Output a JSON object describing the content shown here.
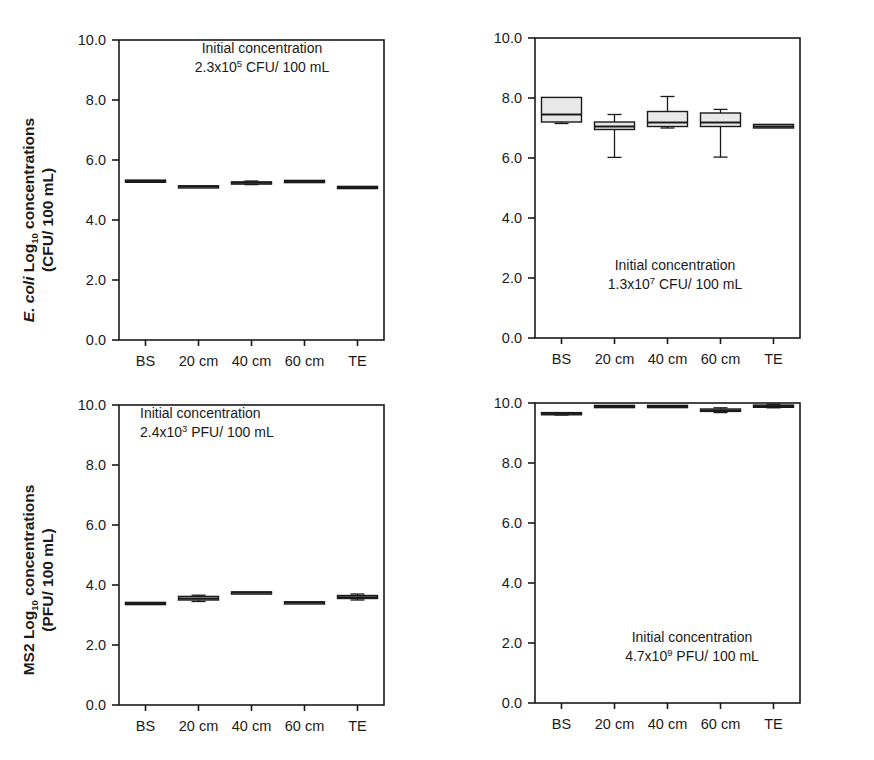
{
  "figure": {
    "background": "#ffffff",
    "line_color": "#1a1a1a",
    "box_fill": "#e8e8e8"
  },
  "axis_titles": {
    "ecoli_line1_italic": "E. coli",
    "ecoli_line1_rest": " Log",
    "ecoli_line1_sub": "10",
    "ecoli_line1_tail": " concentrations",
    "ecoli_line2": "(CFU/ 100 mL)",
    "ms2_line1_main": "MS2 Log",
    "ms2_line1_sub": "10",
    "ms2_line1_tail": " concentrations",
    "ms2_line2": "(PFU/ 100 mL)"
  },
  "axis": {
    "y_ticks": [
      "10.0",
      "8.0",
      "6.0",
      "4.0",
      "2.0",
      "0.0"
    ],
    "y_values": [
      10.0,
      8.0,
      6.0,
      4.0,
      2.0,
      0.0
    ],
    "y_min": 0.0,
    "y_max": 10.0,
    "categories": [
      "BS",
      "20 cm",
      "40 cm",
      "60 cm",
      "TE"
    ]
  },
  "annotations": {
    "line1": "Initial concentration",
    "panel_a": {
      "mantissa": "2.3x10",
      "exponent": "5",
      "units": " CFU/ 100 mL"
    },
    "panel_b": {
      "mantissa": "1.3x10",
      "exponent": "7",
      "units": " CFU/ 100 mL"
    },
    "panel_c": {
      "mantissa": "2.4x10",
      "exponent": "3",
      "units": " PFU/ 100 mL"
    },
    "panel_d": {
      "mantissa": "4.7x10",
      "exponent": "9",
      "units": " PFU/ 100 mL"
    }
  },
  "chart_data": [
    {
      "id": "panel_a",
      "type": "box",
      "title": "",
      "position": "top-left",
      "xlabel": "",
      "ylabel": "E. coli Log10 concentrations (CFU/ 100 mL)",
      "ylim": [
        0.0,
        10.0
      ],
      "yticks": [
        0.0,
        2.0,
        4.0,
        6.0,
        8.0,
        10.0
      ],
      "grid": false,
      "legend": "none",
      "annotation": "Initial concentration 2.3x10^5 CFU/ 100 mL",
      "categories": [
        "BS",
        "20 cm",
        "40 cm",
        "60 cm",
        "TE"
      ],
      "boxes": [
        {
          "category": "BS",
          "whisker_low": 5.25,
          "q1": 5.27,
          "median": 5.3,
          "q3": 5.33,
          "whisker_high": 5.35
        },
        {
          "category": "20 cm",
          "whisker_low": 5.08,
          "q1": 5.1,
          "median": 5.12,
          "q3": 5.14,
          "whisker_high": 5.16
        },
        {
          "category": "40 cm",
          "whisker_low": 5.18,
          "q1": 5.21,
          "median": 5.24,
          "q3": 5.27,
          "whisker_high": 5.3
        },
        {
          "category": "60 cm",
          "whisker_low": 5.27,
          "q1": 5.28,
          "median": 5.3,
          "q3": 5.32,
          "whisker_high": 5.33
        },
        {
          "category": "TE",
          "whisker_low": 5.04,
          "q1": 5.06,
          "median": 5.09,
          "q3": 5.12,
          "whisker_high": 5.14
        }
      ]
    },
    {
      "id": "panel_b",
      "type": "box",
      "title": "",
      "position": "top-right",
      "xlabel": "",
      "ylabel": "",
      "ylim": [
        0.0,
        10.0
      ],
      "yticks": [
        0.0,
        2.0,
        4.0,
        6.0,
        8.0,
        10.0
      ],
      "grid": false,
      "legend": "none",
      "annotation": "Initial concentration 1.3x10^7 CFU/ 100 mL",
      "categories": [
        "BS",
        "20 cm",
        "40 cm",
        "60 cm",
        "TE"
      ],
      "boxes": [
        {
          "category": "BS",
          "whisker_low": 7.15,
          "q1": 7.2,
          "median": 7.45,
          "q3": 8.02,
          "whisker_high": 8.02
        },
        {
          "category": "20 cm",
          "whisker_low": 6.02,
          "q1": 6.95,
          "median": 7.05,
          "q3": 7.2,
          "whisker_high": 7.45
        },
        {
          "category": "40 cm",
          "whisker_low": 7.0,
          "q1": 7.05,
          "median": 7.18,
          "q3": 7.55,
          "whisker_high": 8.05
        },
        {
          "category": "60 cm",
          "whisker_low": 6.03,
          "q1": 7.05,
          "median": 7.18,
          "q3": 7.5,
          "whisker_high": 7.62
        },
        {
          "category": "TE",
          "whisker_low": 6.98,
          "q1": 7.0,
          "median": 7.05,
          "q3": 7.12,
          "whisker_high": 7.14
        }
      ]
    },
    {
      "id": "panel_c",
      "type": "box",
      "title": "",
      "position": "bottom-left",
      "xlabel": "",
      "ylabel": "MS2 Log10 concentrations (PFU/ 100 mL)",
      "ylim": [
        0.0,
        10.0
      ],
      "yticks": [
        0.0,
        2.0,
        4.0,
        6.0,
        8.0,
        10.0
      ],
      "grid": false,
      "legend": "none",
      "annotation": "Initial concentration 2.4x10^3 PFU/ 100 mL",
      "categories": [
        "BS",
        "20 cm",
        "40 cm",
        "60 cm",
        "TE"
      ],
      "boxes": [
        {
          "category": "BS",
          "whisker_low": 3.36,
          "q1": 3.38,
          "median": 3.4,
          "q3": 3.42,
          "whisker_high": 3.44
        },
        {
          "category": "20 cm",
          "whisker_low": 3.45,
          "q1": 3.5,
          "median": 3.55,
          "q3": 3.62,
          "whisker_high": 3.66
        },
        {
          "category": "40 cm",
          "whisker_low": 3.72,
          "q1": 3.73,
          "median": 3.75,
          "q3": 3.77,
          "whisker_high": 3.78
        },
        {
          "category": "60 cm",
          "whisker_low": 3.38,
          "q1": 3.4,
          "median": 3.42,
          "q3": 3.44,
          "whisker_high": 3.46
        },
        {
          "category": "TE",
          "whisker_low": 3.5,
          "q1": 3.55,
          "median": 3.59,
          "q3": 3.65,
          "whisker_high": 3.7
        }
      ]
    },
    {
      "id": "panel_d",
      "type": "box",
      "title": "",
      "position": "bottom-right",
      "xlabel": "",
      "ylabel": "",
      "ylim": [
        0.0,
        10.0
      ],
      "yticks": [
        0.0,
        2.0,
        4.0,
        6.0,
        8.0,
        10.0
      ],
      "grid": false,
      "legend": "none",
      "annotation": "Initial concentration 4.7x10^9 PFU/ 100 mL",
      "categories": [
        "BS",
        "20 cm",
        "40 cm",
        "60 cm",
        "TE"
      ],
      "boxes": [
        {
          "category": "BS",
          "whisker_low": 9.6,
          "q1": 9.63,
          "median": 9.65,
          "q3": 9.68,
          "whisker_high": 9.7
        },
        {
          "category": "20 cm",
          "whisker_low": 9.86,
          "q1": 9.88,
          "median": 9.9,
          "q3": 9.92,
          "whisker_high": 9.94
        },
        {
          "category": "40 cm",
          "whisker_low": 9.86,
          "q1": 9.88,
          "median": 9.9,
          "q3": 9.92,
          "whisker_high": 9.94
        },
        {
          "category": "60 cm",
          "whisker_low": 9.68,
          "q1": 9.72,
          "median": 9.75,
          "q3": 9.8,
          "whisker_high": 9.84
        },
        {
          "category": "TE",
          "whisker_low": 9.84,
          "q1": 9.87,
          "median": 9.9,
          "q3": 9.93,
          "whisker_high": 9.96
        }
      ]
    }
  ]
}
